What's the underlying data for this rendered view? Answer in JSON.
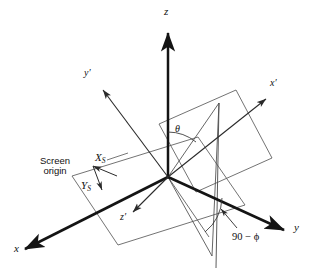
{
  "figure": {
    "type": "3d-axes-diagram",
    "background_color": "#ffffff",
    "line_color": "#1a1a1a",
    "thin_line_color": "#4a4a4a"
  },
  "labels": {
    "z_axis": "z",
    "x_axis": "x",
    "y_axis": "y",
    "x_prime_axis": "x′",
    "y_prime_axis": "y′",
    "z_prime_axis": "z′",
    "screen_origin_line1": "Screen",
    "screen_origin_line2": "origin",
    "screen_x": "X",
    "screen_x_sub": "S",
    "screen_y": "Y",
    "screen_y_sub": "S",
    "theta": "θ",
    "phi_expression_number": "90",
    "phi_expression_minus": "−",
    "phi_expression_symbol": "ϕ"
  },
  "geometry": {
    "origin": {
      "x": 168,
      "y": 177
    },
    "axes": [
      {
        "name": "z",
        "tip_x": 168,
        "tip_y": 28,
        "thick": true
      },
      {
        "name": "x",
        "tip_x": 18,
        "tip_y": 253,
        "thick": true
      },
      {
        "name": "y",
        "tip_x": 290,
        "tip_y": 233,
        "thick": true
      },
      {
        "name": "y-prime",
        "tip_x": 99,
        "tip_y": 85,
        "thick": false
      },
      {
        "name": "x-prime",
        "tip_x": 272,
        "tip_y": 95,
        "thick": false
      },
      {
        "name": "z-prime",
        "tip_x": 129,
        "tip_y": 215,
        "thick": false
      }
    ],
    "ground_plane": [
      {
        "x": 72,
        "y": 176
      },
      {
        "x": 198,
        "y": 137
      },
      {
        "x": 245,
        "y": 205
      },
      {
        "x": 118,
        "y": 245
      }
    ],
    "upright_plane": [
      {
        "x": 159,
        "y": 124
      },
      {
        "x": 236,
        "y": 90
      },
      {
        "x": 272,
        "y": 158
      },
      {
        "x": 196,
        "y": 192
      }
    ]
  }
}
